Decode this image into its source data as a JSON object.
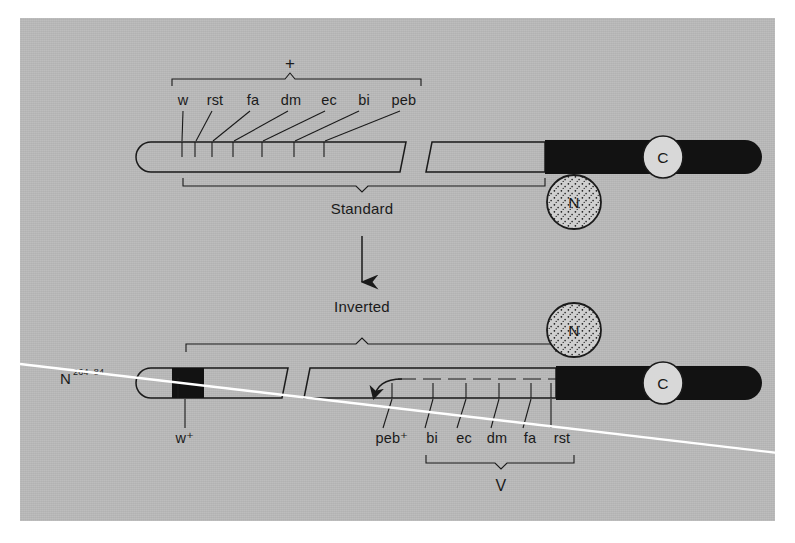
{
  "figure": {
    "title_visible": false,
    "background_color": "#b8b8b8",
    "ink_color": "#1a1a1a",
    "overlay_line_color": "#ffffff"
  },
  "annotations": {
    "plus_symbol": "+",
    "standard_label": "Standard",
    "inverted_label": "Inverted",
    "v_label": "V",
    "nucleolus_label": "N",
    "centromere_label": "C",
    "strain_label_base": "N",
    "strain_label_superscript": "264–84"
  },
  "top_chromosome": {
    "name": "Standard sequence chromosome",
    "marker_labels": [
      "w",
      "rst",
      "fa",
      "dm",
      "ec",
      "bi",
      "peb"
    ],
    "marker_label_x": [
      180,
      215,
      253,
      291,
      329,
      365,
      404
    ],
    "tick_x": [
      182,
      195,
      212,
      233,
      262,
      294,
      324
    ],
    "bracket_top_label": "+",
    "bracket_bottom_label": "Standard"
  },
  "bottom_chromosome": {
    "name": "Inverted sequence chromosome",
    "left_marker_label": "w⁺",
    "right_marker_labels": [
      "peb⁺",
      "bi",
      "ec",
      "dm",
      "fa",
      "rst"
    ],
    "right_marker_label_x": [
      390,
      432,
      464,
      497,
      530,
      561
    ],
    "tick_x": [
      392,
      433,
      466,
      499,
      531,
      551
    ],
    "bracket_top_label": "Inverted",
    "bracket_bottom_label": "V",
    "strain_label": "N264–84"
  },
  "legend_items": [
    {
      "icon": "nucleolus-organizer-circle",
      "label": "N"
    },
    {
      "icon": "centromere-circle",
      "label": "C"
    }
  ]
}
